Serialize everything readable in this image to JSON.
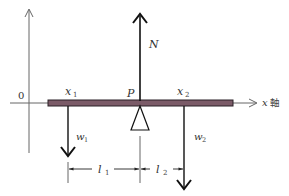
{
  "diagram": {
    "colors": {
      "axis": "#555555",
      "beam_fill": "#7b5b68",
      "beam_stroke": "#2b2026",
      "force": "#111111",
      "text": "#333333"
    },
    "axes": {
      "origin_label": "0",
      "x_axis_label_var": "x",
      "x_axis_label_suffix": "軸"
    },
    "beam": {
      "pivot_label": "P",
      "x1_var": "x",
      "x1_sub": "1",
      "x2_var": "x",
      "x2_sub": "2"
    },
    "forces": {
      "normal": {
        "var": "N"
      },
      "w1": {
        "var": "w",
        "sub": "1"
      },
      "w2": {
        "var": "w",
        "sub": "2"
      }
    },
    "dimensions": {
      "l1": {
        "var": "l",
        "sub": "1"
      },
      "l2": {
        "var": "l",
        "sub": "2"
      }
    }
  }
}
